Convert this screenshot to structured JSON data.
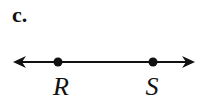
{
  "part_label": "c.",
  "figure": {
    "type": "line",
    "arrows": "both-ends",
    "points": [
      {
        "name": "R",
        "label": "R"
      },
      {
        "name": "S",
        "label": "S"
      }
    ]
  }
}
